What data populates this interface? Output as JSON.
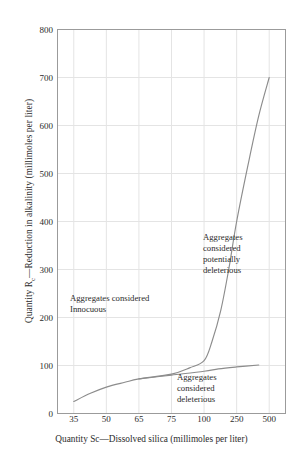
{
  "chart_data": {
    "type": "line",
    "title": "",
    "xlabel": "Quantity Sc—Dissolved silica (millimoles per liter)",
    "ylabel_prefix": "Quantity R",
    "ylabel_sub": "c",
    "ylabel_suffix": "—Reduction in alkalinity (millimoles per liter)",
    "ylabel_full": "Quantity Rc—Reduction in alkalinity (millimoles per liter)",
    "xticklabels": [
      "35",
      "50",
      "65",
      "75",
      "100",
      "250",
      "500"
    ],
    "xtickvalues": [
      35,
      50,
      65,
      75,
      100,
      250,
      500
    ],
    "yticklabels": [
      "0",
      "100",
      "200",
      "300",
      "400",
      "500",
      "600",
      "700",
      "800"
    ],
    "ytickvalues": [
      0,
      100,
      200,
      300,
      400,
      500,
      600,
      700,
      800
    ],
    "ylim": [
      0,
      800
    ],
    "xscale": "categorical-log",
    "grid": true,
    "legend": "none",
    "line_color": "#8c8c8c",
    "grid_color": "#e4e4e4",
    "axis_color": "#9b9b9b",
    "background": "#ffffff",
    "series": [
      {
        "name": "upper-boundary",
        "description": "Boundary between innocuous and potentially deleterious aggregates; rises steeply at high dissolved silica",
        "points": [
          {
            "x_label": "35",
            "x": 35,
            "y": 25
          },
          {
            "x_label": "42",
            "x": 42,
            "y": 42
          },
          {
            "x_label": "50",
            "x": 50,
            "y": 55
          },
          {
            "x_label": "58",
            "x": 58,
            "y": 65
          },
          {
            "x_label": "65",
            "x": 65,
            "y": 72
          },
          {
            "x_label": "75",
            "x": 75,
            "y": 82
          },
          {
            "x_label": "88",
            "x": 88,
            "y": 95
          },
          {
            "x_label": "100",
            "x": 100,
            "y": 110
          },
          {
            "x_label": "125",
            "x": 125,
            "y": 150
          },
          {
            "x_label": "160",
            "x": 160,
            "y": 215
          },
          {
            "x_label": "200",
            "x": 200,
            "y": 300
          },
          {
            "x_label": "250",
            "x": 250,
            "y": 400
          },
          {
            "x_label": "320",
            "x": 320,
            "y": 520
          },
          {
            "x_label": "400",
            "x": 400,
            "y": 620
          },
          {
            "x_label": "500",
            "x": 500,
            "y": 700
          }
        ]
      },
      {
        "name": "lower-boundary",
        "description": "Boundary below which aggregates are considered deleterious; flattens toward 100",
        "points": [
          {
            "x_label": "65",
            "x": 65,
            "y": 72
          },
          {
            "x_label": "75",
            "x": 75,
            "y": 80
          },
          {
            "x_label": "100",
            "x": 100,
            "y": 88
          },
          {
            "x_label": "150",
            "x": 150,
            "y": 93
          },
          {
            "x_label": "250",
            "x": 250,
            "y": 97
          },
          {
            "x_label": "400",
            "x": 400,
            "y": 101
          }
        ]
      }
    ],
    "annotations": [
      {
        "name": "innocuous",
        "lines": [
          "Aggregates considered",
          "Innocuous"
        ],
        "region": "left of upper boundary"
      },
      {
        "name": "potentially-deleterious",
        "lines": [
          "Aggregates",
          "considered",
          "potentially",
          "deleterious"
        ],
        "region": "right of upper boundary"
      },
      {
        "name": "deleterious",
        "lines": [
          "Aggregates",
          "considered",
          "deleterious"
        ],
        "region": "below lower boundary"
      }
    ]
  }
}
